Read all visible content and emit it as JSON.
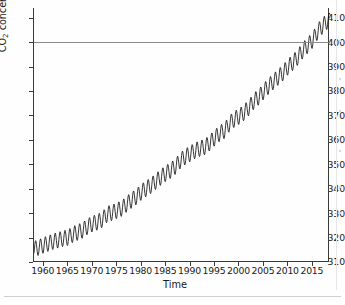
{
  "figure": {
    "background_color": "#fefefe",
    "line_color": "#101010",
    "axis_color": "#3a3a3a",
    "reference_line_color": "#8b8b8b",
    "x_axis_title": "Time",
    "y_axis_title_prefix": "CO",
    "y_axis_title_subscript": "2",
    "y_axis_title_suffix": " concentration (ppm)"
  },
  "chart_data": {
    "type": "line",
    "title": "",
    "subtitle": "",
    "xlabel": "Time",
    "ylabel": "CO2 concentration (ppm)",
    "xlim": [
      1958,
      2018.5
    ],
    "ylim": [
      310,
      414
    ],
    "grid": false,
    "legend": false,
    "legend_position": "none",
    "xticks": [
      1960,
      1965,
      1970,
      1975,
      1980,
      1985,
      1990,
      1995,
      2000,
      2005,
      2010,
      2015
    ],
    "xtick_labels": [
      "1960",
      "1965",
      "1970",
      "1975",
      "1980",
      "1985",
      "1990",
      "1995",
      "2000",
      "2005",
      "2010",
      "2015"
    ],
    "yticks": [
      310,
      320,
      330,
      340,
      350,
      360,
      370,
      380,
      390,
      400,
      410
    ],
    "ytick_labels": [
      "310",
      "320",
      "330",
      "340",
      "350",
      "360",
      "370",
      "380",
      "390",
      "400",
      "410"
    ],
    "annotations": [
      {
        "type": "hline",
        "y": 400,
        "label": "",
        "color": "#8b8b8b"
      }
    ],
    "series": [
      {
        "name": "Mauna Loa monthly mean CO2",
        "description": "Keeling curve: monthly mean atmospheric CO2 concentration with annual seasonal cycle superimposed on a rising trend.",
        "seasonal_amplitude_ppm": 3.2,
        "seasonal_peak_month": 5,
        "seasonal_trough_month": 9,
        "annual_means": [
          {
            "x": 1958,
            "y": 315.3
          },
          {
            "x": 1959,
            "y": 315.98
          },
          {
            "x": 1960,
            "y": 316.91
          },
          {
            "x": 1961,
            "y": 317.64
          },
          {
            "x": 1962,
            "y": 318.45
          },
          {
            "x": 1963,
            "y": 318.99
          },
          {
            "x": 1964,
            "y": 319.62
          },
          {
            "x": 1965,
            "y": 320.04
          },
          {
            "x": 1966,
            "y": 321.37
          },
          {
            "x": 1967,
            "y": 322.18
          },
          {
            "x": 1968,
            "y": 323.05
          },
          {
            "x": 1969,
            "y": 324.62
          },
          {
            "x": 1970,
            "y": 325.68
          },
          {
            "x": 1971,
            "y": 326.32
          },
          {
            "x": 1972,
            "y": 327.46
          },
          {
            "x": 1973,
            "y": 329.68
          },
          {
            "x": 1974,
            "y": 330.19
          },
          {
            "x": 1975,
            "y": 331.12
          },
          {
            "x": 1976,
            "y": 332.03
          },
          {
            "x": 1977,
            "y": 333.84
          },
          {
            "x": 1978,
            "y": 335.41
          },
          {
            "x": 1979,
            "y": 336.84
          },
          {
            "x": 1980,
            "y": 338.76
          },
          {
            "x": 1981,
            "y": 340.12
          },
          {
            "x": 1982,
            "y": 341.48
          },
          {
            "x": 1983,
            "y": 343.15
          },
          {
            "x": 1984,
            "y": 344.87
          },
          {
            "x": 1985,
            "y": 346.35
          },
          {
            "x": 1986,
            "y": 347.61
          },
          {
            "x": 1987,
            "y": 349.31
          },
          {
            "x": 1988,
            "y": 351.69
          },
          {
            "x": 1989,
            "y": 353.2
          },
          {
            "x": 1990,
            "y": 354.45
          },
          {
            "x": 1991,
            "y": 355.7
          },
          {
            "x": 1992,
            "y": 356.54
          },
          {
            "x": 1993,
            "y": 357.21
          },
          {
            "x": 1994,
            "y": 358.96
          },
          {
            "x": 1995,
            "y": 360.97
          },
          {
            "x": 1996,
            "y": 362.74
          },
          {
            "x": 1997,
            "y": 363.88
          },
          {
            "x": 1998,
            "y": 366.84
          },
          {
            "x": 1999,
            "y": 368.54
          },
          {
            "x": 2000,
            "y": 369.71
          },
          {
            "x": 2001,
            "y": 371.32
          },
          {
            "x": 2002,
            "y": 373.45
          },
          {
            "x": 2003,
            "y": 375.98
          },
          {
            "x": 2004,
            "y": 377.7
          },
          {
            "x": 2005,
            "y": 379.98
          },
          {
            "x": 2006,
            "y": 382.09
          },
          {
            "x": 2007,
            "y": 384.02
          },
          {
            "x": 2008,
            "y": 385.83
          },
          {
            "x": 2009,
            "y": 387.64
          },
          {
            "x": 2010,
            "y": 390.1
          },
          {
            "x": 2011,
            "y": 391.85
          },
          {
            "x": 2012,
            "y": 394.06
          },
          {
            "x": 2013,
            "y": 396.74
          },
          {
            "x": 2014,
            "y": 398.81
          },
          {
            "x": 2015,
            "y": 401.01
          },
          {
            "x": 2016,
            "y": 404.41
          },
          {
            "x": 2017,
            "y": 406.76
          },
          {
            "x": 2018,
            "y": 408.72
          }
        ]
      }
    ]
  }
}
